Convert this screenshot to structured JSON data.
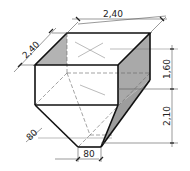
{
  "diagram": {
    "type": "isometric hopper drawing",
    "dimensions": {
      "top_width": "2,40",
      "top_depth": "2,40",
      "box_height": "1,60",
      "funnel_height": "2,10",
      "outlet_depth": "80",
      "outlet_width": "80"
    },
    "colors": {
      "line": "#111111",
      "shade": "#a9a9a9",
      "dim_line": "#555555"
    }
  }
}
